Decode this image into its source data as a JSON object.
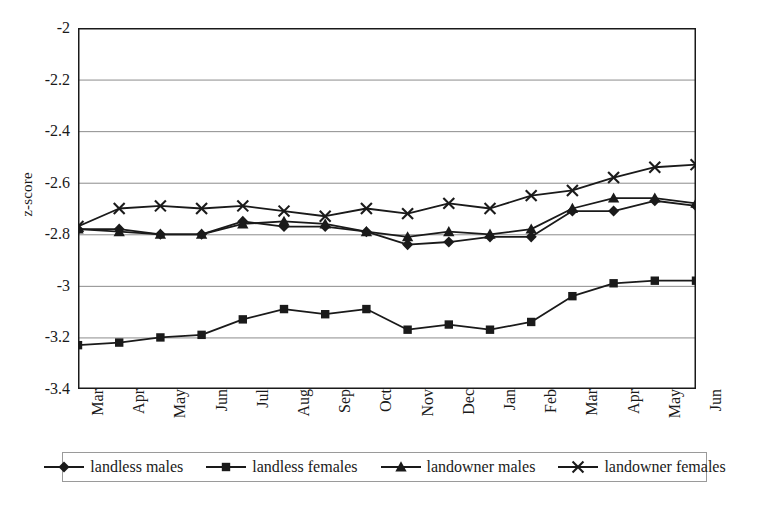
{
  "chart_data": {
    "type": "line",
    "title": "",
    "xlabel": "",
    "ylabel": "z-score",
    "ylim": [
      -3.4,
      -2.0
    ],
    "yticks": [
      "-2",
      "-2.2",
      "-2.4",
      "-2.6",
      "-2.8",
      "-3",
      "-3.2",
      "-3.4"
    ],
    "ytick_values": [
      -2.0,
      -2.2,
      -2.4,
      -2.6,
      -2.8,
      -3.0,
      -3.2,
      -3.4
    ],
    "grid": true,
    "grid_axis": "y",
    "legend_position": "bottom",
    "categories": [
      "Mar",
      "Apr",
      "May",
      "Jun",
      "Jul",
      "Aug",
      "Sep",
      "Oct",
      "Nov",
      "Dec",
      "Jan",
      "Feb",
      "Mar",
      "Apr",
      "May",
      "Jun"
    ],
    "series": [
      {
        "name": "landless males",
        "marker": "diamond",
        "color": "#1a1a1a",
        "values": [
          -2.78,
          -2.78,
          -2.8,
          -2.8,
          -2.75,
          -2.77,
          -2.77,
          -2.79,
          -2.84,
          -2.83,
          -2.81,
          -2.81,
          -2.71,
          -2.71,
          -2.67,
          -2.69
        ]
      },
      {
        "name": "landless females",
        "marker": "square",
        "color": "#1a1a1a",
        "values": [
          -3.23,
          -3.22,
          -3.2,
          -3.19,
          -3.13,
          -3.09,
          -3.11,
          -3.09,
          -3.17,
          -3.15,
          -3.17,
          -3.14,
          -3.04,
          -2.99,
          -2.98,
          -2.98
        ]
      },
      {
        "name": "landowner males",
        "marker": "triangle",
        "color": "#1a1a1a",
        "values": [
          -2.78,
          -2.79,
          -2.8,
          -2.8,
          -2.76,
          -2.75,
          -2.76,
          -2.79,
          -2.81,
          -2.79,
          -2.8,
          -2.78,
          -2.7,
          -2.66,
          -2.66,
          -2.68
        ]
      },
      {
        "name": "landowner females",
        "marker": "cross",
        "color": "#1a1a1a",
        "values": [
          -2.77,
          -2.7,
          -2.69,
          -2.7,
          -2.69,
          -2.71,
          -2.73,
          -2.7,
          -2.72,
          -2.68,
          -2.7,
          -2.65,
          -2.63,
          -2.58,
          -2.54,
          -2.53
        ]
      }
    ]
  }
}
